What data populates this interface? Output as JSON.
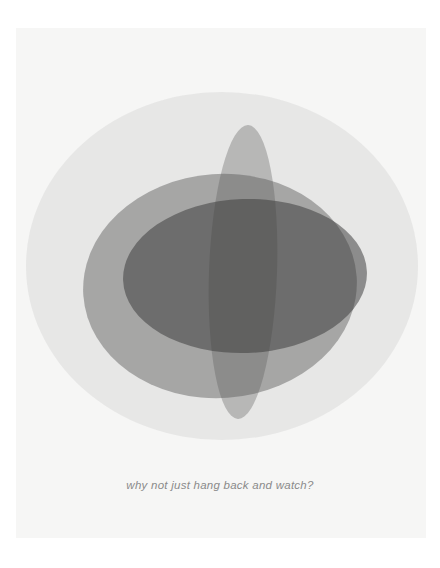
{
  "page": {
    "width": 440,
    "height": 568,
    "background_color": "#ffffff",
    "panel_color": "#f6f6f5"
  },
  "caption": {
    "text": "why not just hang back and watch?",
    "color": "#8a8a8a",
    "style": "italic",
    "align": "center"
  },
  "artwork": {
    "name": "overlapping-translucent-ellipses",
    "description": "Four overlapping semi-transparent grey ellipses forming a layered abstract bloom",
    "shapes": [
      {
        "name": "outer-light-ellipse",
        "shape": "ellipse",
        "cx": 222,
        "cy": 266,
        "rx": 196,
        "ry": 174,
        "fill": "#9a9a9a",
        "opacity": 0.16,
        "rotation": 0
      },
      {
        "name": "mid-grey-ellipse",
        "shape": "ellipse",
        "cx": 220,
        "cy": 286,
        "rx": 137,
        "ry": 112,
        "fill": "#4c4c4c",
        "opacity": 0.42,
        "rotation": -4
      },
      {
        "name": "vertical-narrow-ellipse",
        "shape": "ellipse",
        "cx": 243,
        "cy": 272,
        "rx": 34,
        "ry": 147,
        "fill": "#5a5a5a",
        "opacity": 0.34,
        "rotation": 2
      },
      {
        "name": "dark-horizontal-ellipse",
        "shape": "ellipse",
        "cx": 245,
        "cy": 276,
        "rx": 122,
        "ry": 77,
        "fill": "#3a3a3a",
        "opacity": 0.52,
        "rotation": -2
      }
    ]
  }
}
